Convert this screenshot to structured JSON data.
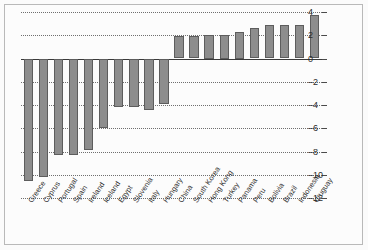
{
  "chart_data": {
    "type": "bar",
    "title": "",
    "subtitle": "",
    "xlabel": "",
    "ylabel": "",
    "ylim": [
      -12,
      4
    ],
    "yticks": [
      4,
      2,
      0,
      -2,
      -4,
      -6,
      -8,
      -10,
      -12
    ],
    "ytick_labels": [
      "4",
      "2",
      "0",
      "–2",
      "–4",
      "–6",
      "–8",
      "–10",
      "–12"
    ],
    "grid": true,
    "legend": null,
    "legend_position": "none",
    "bar_color": "#8d8d8d",
    "bar_edge_color": "#5d5d5d",
    "categories": [
      "Greece",
      "Cyprus",
      "Portugal",
      "Spain",
      "Ireland",
      "Iceland",
      "Egypt",
      "Slovenia",
      "Italy",
      "Hungary",
      "China",
      "South Korea",
      "Hong Kong",
      "Turkey",
      "Panama",
      "Peru",
      "Bolivia",
      "Brazil",
      "Indonesia",
      "Uruguay"
    ],
    "values": [
      -10.5,
      -10.2,
      -8.3,
      -8.3,
      -7.9,
      -6.0,
      -4.2,
      -4.2,
      -4.4,
      -3.9,
      1.9,
      1.9,
      2.0,
      2.0,
      2.25,
      2.6,
      2.9,
      2.9,
      2.9,
      3.7
    ]
  }
}
